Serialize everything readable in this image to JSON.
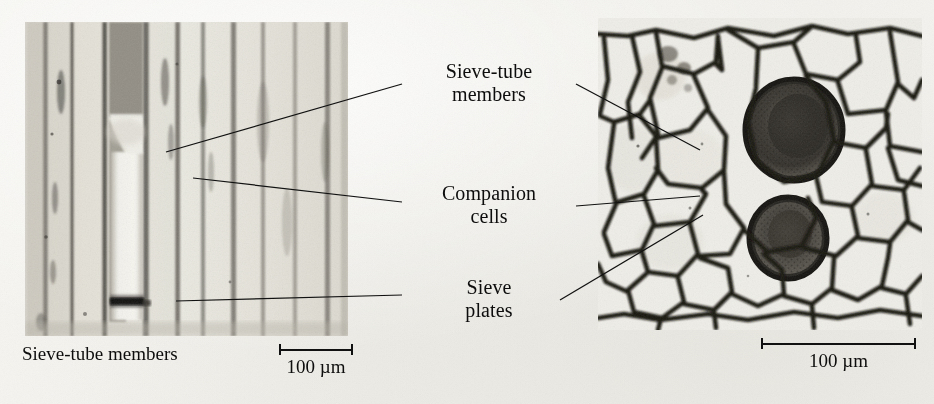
{
  "figure": {
    "background_color": "#f3f2ee",
    "ink_color": "#111111"
  },
  "panels": [
    {
      "id": "longitudinal",
      "name": "longitudinal-section-micrograph",
      "caption": "Sieve-tube members",
      "scalebar": {
        "label": "100 µm"
      }
    },
    {
      "id": "cross",
      "name": "cross-section-micrograph",
      "caption": "",
      "scalebar": {
        "label": "100 µm"
      }
    }
  ],
  "callouts": [
    {
      "id": "sieve-tube-members",
      "line1": "Sieve-tube",
      "line2": "members"
    },
    {
      "id": "companion-cells",
      "line1": "Companion",
      "line2": "cells"
    },
    {
      "id": "sieve-plates",
      "line1": "Sieve",
      "line2": "plates"
    }
  ],
  "leader_lines": [
    {
      "id": "sieve-tube-members-left",
      "from": [
        166,
        152
      ],
      "to": [
        402,
        84
      ]
    },
    {
      "id": "sieve-tube-members-right",
      "from": [
        576,
        84
      ],
      "to": [
        700,
        150
      ]
    },
    {
      "id": "companion-cells-left",
      "from": [
        193,
        178
      ],
      "to": [
        402,
        202
      ]
    },
    {
      "id": "companion-cells-right",
      "from": [
        576,
        206
      ],
      "to": [
        700,
        196
      ]
    },
    {
      "id": "sieve-plates-left",
      "from": [
        176,
        301
      ],
      "to": [
        402,
        295
      ]
    },
    {
      "id": "sieve-plates-right",
      "from": [
        560,
        300
      ],
      "to": [
        703,
        215
      ]
    }
  ]
}
